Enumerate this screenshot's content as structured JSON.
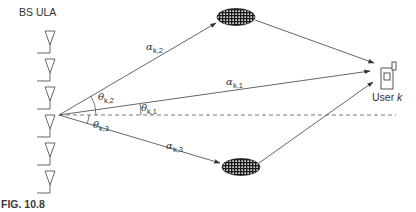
{
  "diagram": {
    "bs_label": "BS ULA",
    "user_label_prefix": "User ",
    "user_label_var": "k",
    "figure_caption": "FIG. 10.8",
    "antenna_count": 6,
    "paths": [
      {
        "id": "direct",
        "alpha_symbol": "α",
        "alpha_sub": "k,1",
        "theta_symbol": "θ",
        "theta_sub": "k,1"
      },
      {
        "id": "scatter-top",
        "alpha_symbol": "α",
        "alpha_sub": "k,2",
        "theta_symbol": "θ",
        "theta_sub": "k,2"
      },
      {
        "id": "scatter-bottom",
        "alpha_symbol": "α",
        "alpha_sub": "k,3",
        "theta_symbol": "θ",
        "theta_sub": "k,3"
      }
    ],
    "colors": {
      "line": "#555555",
      "scatterer_fill": "#222222",
      "background": "#ffffff"
    }
  }
}
